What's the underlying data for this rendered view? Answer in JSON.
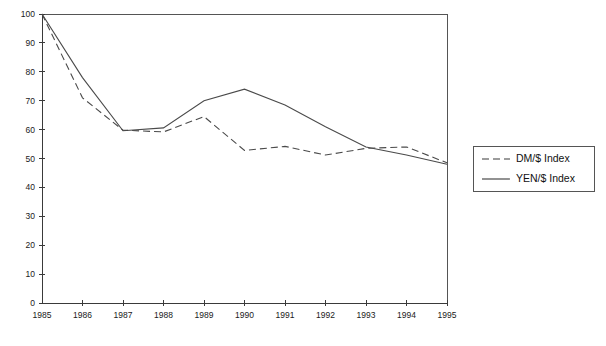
{
  "chart_data": {
    "type": "line",
    "title": "",
    "xlabel": "",
    "ylabel": "",
    "x": [
      1985,
      1986,
      1987,
      1988,
      1989,
      1990,
      1991,
      1992,
      1993,
      1994,
      1995
    ],
    "categories": [
      "1985",
      "1986",
      "1987",
      "1988",
      "1989",
      "1990",
      "1991",
      "1992",
      "1993",
      "1994",
      "1995"
    ],
    "xlim": [
      1985,
      1995
    ],
    "ylim": [
      0,
      100
    ],
    "yticks": [
      0,
      10,
      20,
      30,
      40,
      50,
      60,
      70,
      80,
      90,
      100
    ],
    "ytick_labels": [
      "0",
      "10",
      "20",
      "30",
      "40",
      "50",
      "60",
      "70",
      "80",
      "90",
      "100"
    ],
    "grid": false,
    "legend_position": "right-outside",
    "series": [
      {
        "name": "DM/$ Index",
        "style": "dashed",
        "color": "#4a4a4a",
        "values": [
          100,
          71,
          59.8,
          59.2,
          64.5,
          52.8,
          54.2,
          51.2,
          53.5,
          54,
          48.5
        ]
      },
      {
        "name": "YEN/$ Index",
        "style": "solid",
        "color": "#4a4a4a",
        "values": [
          100,
          78,
          59.6,
          60.6,
          70,
          74,
          68.5,
          61,
          54,
          51.2,
          48
        ]
      }
    ]
  },
  "legend": {
    "items": [
      {
        "label": "DM/$ Index",
        "style": "dashed"
      },
      {
        "label": "YEN/$ Index",
        "style": "solid"
      }
    ]
  }
}
